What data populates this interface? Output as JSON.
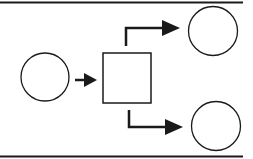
{
  "diagram": {
    "type": "flow",
    "colors": {
      "stroke": "#1a1a1a",
      "fill": "#ffffff"
    },
    "nodes": [
      {
        "id": "input",
        "shape": "circle",
        "label": ""
      },
      {
        "id": "process",
        "shape": "square",
        "label": ""
      },
      {
        "id": "output-top",
        "shape": "circle",
        "label": ""
      },
      {
        "id": "output-bottom",
        "shape": "circle",
        "label": ""
      }
    ],
    "edges": [
      {
        "from": "input",
        "to": "process"
      },
      {
        "from": "process",
        "to": "output-top"
      },
      {
        "from": "process",
        "to": "output-bottom"
      }
    ]
  }
}
